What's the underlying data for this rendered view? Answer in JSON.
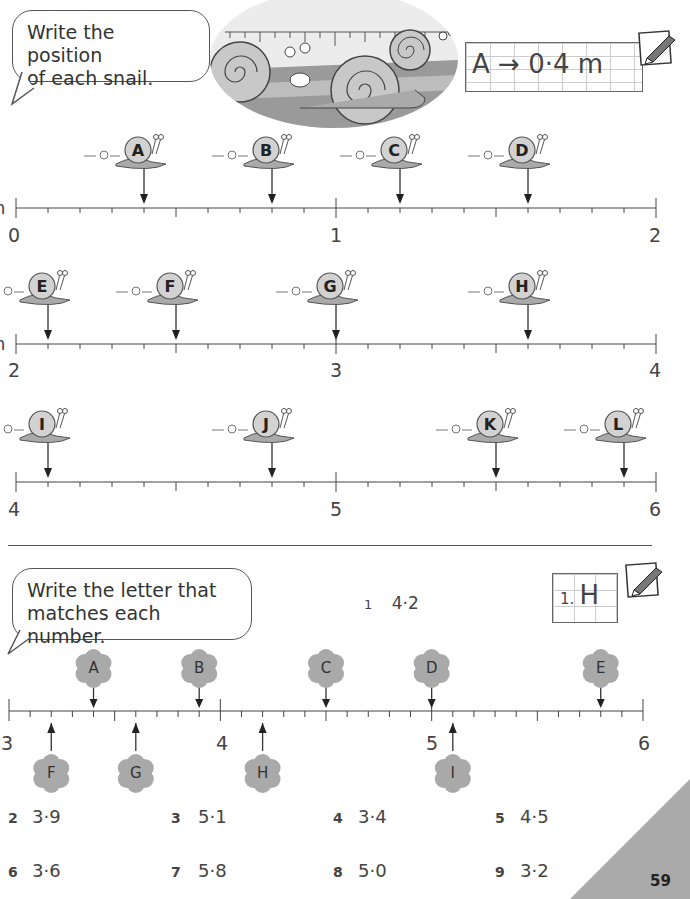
{
  "section1": {
    "instruction": "Write the position of each snail.",
    "instruction_lines": [
      "Write the position",
      "of each snail."
    ],
    "example": {
      "letter": "A",
      "arrow": "→",
      "value": "0·4 m"
    },
    "unit_hint": "m",
    "number_lines": [
      {
        "start_label": "0",
        "mid_label": "1",
        "end_label": "2",
        "start": 0,
        "end": 2,
        "snails": [
          {
            "letter": "A",
            "value": 0.4
          },
          {
            "letter": "B",
            "value": 0.8
          },
          {
            "letter": "C",
            "value": 1.2
          },
          {
            "letter": "D",
            "value": 1.6
          }
        ]
      },
      {
        "start_label": "2",
        "mid_label": "3",
        "end_label": "4",
        "start": 2,
        "end": 4,
        "snails": [
          {
            "letter": "E",
            "value": 2.1
          },
          {
            "letter": "F",
            "value": 2.5
          },
          {
            "letter": "G",
            "value": 3.0
          },
          {
            "letter": "H",
            "value": 3.6
          }
        ]
      },
      {
        "start_label": "4",
        "mid_label": "5",
        "end_label": "6",
        "start": 4,
        "end": 6,
        "snails": [
          {
            "letter": "I",
            "value": 4.1
          },
          {
            "letter": "J",
            "value": 4.8
          },
          {
            "letter": "K",
            "value": 5.5
          },
          {
            "letter": "L",
            "value": 5.9
          }
        ]
      }
    ]
  },
  "section2": {
    "instruction": "Write the letter that matches each number.",
    "instruction_lines": [
      "Write the letter that",
      "matches each number."
    ],
    "example": {
      "number": "1.",
      "letter": "H"
    },
    "first_question": {
      "num": "1",
      "value": "4·2"
    },
    "number_line": {
      "labels": [
        "3",
        "4",
        "5",
        "6"
      ],
      "start": 3,
      "end": 6,
      "above": [
        {
          "letter": "A",
          "value": 3.4
        },
        {
          "letter": "B",
          "value": 3.9
        },
        {
          "letter": "C",
          "value": 4.5
        },
        {
          "letter": "D",
          "value": 5.0
        },
        {
          "letter": "E",
          "value": 5.8
        }
      ],
      "below": [
        {
          "letter": "F",
          "value": 3.2
        },
        {
          "letter": "G",
          "value": 3.6
        },
        {
          "letter": "H",
          "value": 4.2
        },
        {
          "letter": "I",
          "value": 5.1
        }
      ]
    },
    "questions": [
      {
        "num": "2",
        "value": "3·9"
      },
      {
        "num": "3",
        "value": "5·1"
      },
      {
        "num": "4",
        "value": "3·4"
      },
      {
        "num": "5",
        "value": "4·5"
      },
      {
        "num": "6",
        "value": "3·6"
      },
      {
        "num": "7",
        "value": "5·8"
      },
      {
        "num": "8",
        "value": "5·0"
      },
      {
        "num": "9",
        "value": "3·2"
      }
    ]
  },
  "page_number": "59",
  "colors": {
    "ink": "#333333",
    "shell": "#c8c8c8",
    "cloud": "#a9a9a9",
    "corner": "#aaaaaa",
    "grid": "#cccccc"
  }
}
